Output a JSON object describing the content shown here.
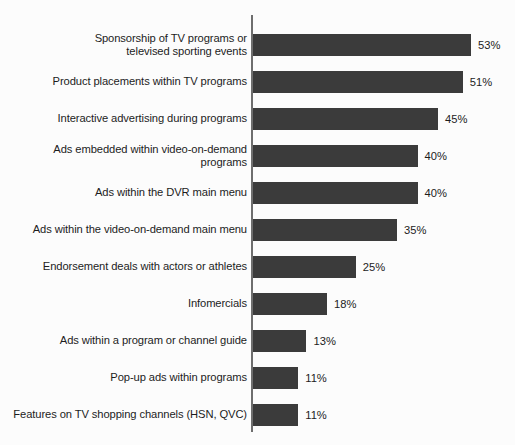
{
  "chart_data": {
    "type": "bar",
    "orientation": "horizontal",
    "title": "",
    "subtitle": "",
    "xlabel": "",
    "ylabel": "",
    "xlim": [
      0,
      53
    ],
    "grid": false,
    "legend": null,
    "value_suffix": "%",
    "categories": [
      "Sponsorship of TV programs or\ntelevised sporting events",
      "Product placements within TV programs",
      "Interactive advertising during programs",
      "Ads embedded within video-on-demand\nprograms",
      "Ads within the DVR main menu",
      "Ads within the video-on-demand main menu",
      "Endorsement deals with actors or athletes",
      "Infomercials",
      "Ads within a program or channel guide",
      "Pop-up ads within programs",
      "Features on TV shopping channels (HSN, QVC)"
    ],
    "values": [
      53,
      51,
      45,
      40,
      40,
      35,
      25,
      18,
      13,
      11,
      11
    ],
    "value_labels": [
      "53%",
      "51%",
      "45%",
      "40%",
      "40%",
      "35%",
      "25%",
      "18%",
      "13%",
      "11%",
      "11%"
    ],
    "label_lines": [
      2,
      1,
      1,
      2,
      1,
      1,
      1,
      1,
      1,
      1,
      1
    ],
    "colors": {
      "bar": "#3b3b3b",
      "axis": "#6e6e6e",
      "text": "#1d1d1d",
      "background": "#fcfcfc"
    }
  }
}
